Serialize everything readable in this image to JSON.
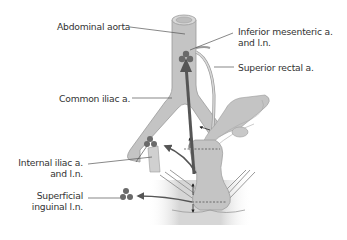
{
  "diagram": {
    "colors": {
      "tissue": "#c4c4c4",
      "tissue_light": "#d4d4d4",
      "tissue_stroke": "#9a9a9a",
      "node": "#6a6a6a",
      "arrow": "#555555",
      "leader": "#555555",
      "text": "#333333"
    },
    "labels": {
      "abdominal_aorta": "Abdominal aorta",
      "inferior_mesenteric_line1": "Inferior mesenteric a.",
      "inferior_mesenteric_line2": "and l.n.",
      "superior_rectal": "Superior rectal a.",
      "common_iliac": "Common iliac a.",
      "internal_iliac_line1": "Internal iliac a.",
      "internal_iliac_line2": "and l.n.",
      "superficial_inguinal_line1": "Superficial",
      "superficial_inguinal_line2": "inguinal l.n."
    }
  }
}
